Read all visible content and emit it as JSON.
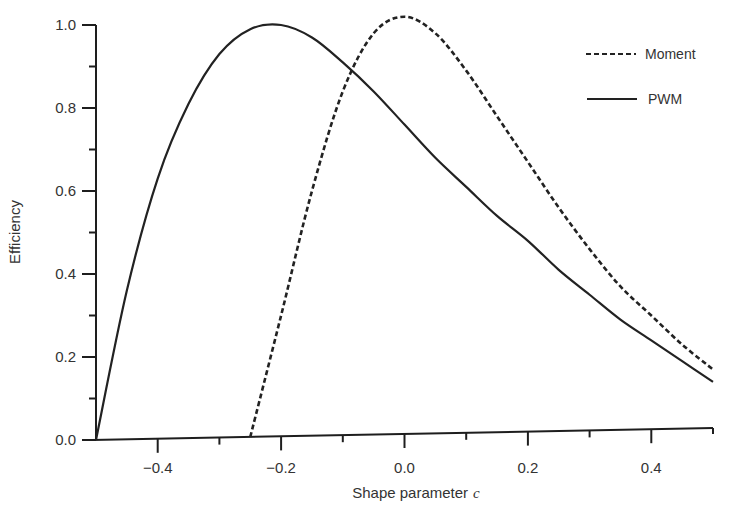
{
  "chart_data": {
    "type": "line",
    "title": "",
    "xlabel": "Shape parameter",
    "xlabel_var": "c",
    "ylabel": "Efficiency",
    "xlim": [
      -0.5,
      0.5
    ],
    "ylim": [
      0.0,
      1.0
    ],
    "grid": false,
    "legend_position": "upper right",
    "x_ticks": [
      -0.4,
      -0.2,
      0.0,
      0.2,
      0.4
    ],
    "x_tick_labels": [
      "−0.4",
      "−0.2",
      "0.0",
      "0.2",
      "0.4"
    ],
    "x_minor_ticks": [
      -0.5,
      -0.3,
      -0.1,
      0.1,
      0.3,
      0.5
    ],
    "y_ticks": [
      0.0,
      0.2,
      0.4,
      0.6,
      0.8,
      1.0
    ],
    "y_tick_labels": [
      "0.0",
      "0.2",
      "0.4",
      "0.6",
      "0.8",
      "1.0"
    ],
    "y_minor_ticks": [
      0.1,
      0.3,
      0.5,
      0.7,
      0.9
    ],
    "series": [
      {
        "name": "Moment",
        "style": "dashed",
        "x": [
          -0.25,
          -0.2,
          -0.15,
          -0.1,
          -0.05,
          0.0,
          0.05,
          0.1,
          0.15,
          0.2,
          0.25,
          0.3,
          0.35,
          0.4,
          0.45,
          0.5
        ],
        "values": [
          0.0,
          0.3,
          0.6,
          0.84,
          0.98,
          1.02,
          0.98,
          0.89,
          0.78,
          0.67,
          0.56,
          0.46,
          0.37,
          0.3,
          0.23,
          0.17
        ]
      },
      {
        "name": "PWM",
        "style": "solid",
        "x": [
          -0.5,
          -0.45,
          -0.4,
          -0.35,
          -0.3,
          -0.25,
          -0.2,
          -0.15,
          -0.1,
          -0.05,
          0.0,
          0.05,
          0.1,
          0.15,
          0.2,
          0.25,
          0.3,
          0.35,
          0.4,
          0.45,
          0.5
        ],
        "values": [
          0.0,
          0.36,
          0.63,
          0.81,
          0.93,
          0.99,
          1.0,
          0.97,
          0.91,
          0.84,
          0.76,
          0.68,
          0.61,
          0.54,
          0.48,
          0.41,
          0.35,
          0.29,
          0.24,
          0.19,
          0.14
        ]
      }
    ]
  },
  "legend": {
    "items": [
      {
        "label": "Moment",
        "style": "dashed"
      },
      {
        "label": "PWM",
        "style": "solid"
      }
    ]
  },
  "axes": {
    "xlabel": "Shape parameter",
    "xlabel_var": "c",
    "ylabel": "Efficiency"
  },
  "colors": {
    "line": "#222222",
    "axis": "#1e1e1e",
    "text": "#333333",
    "background": "#ffffff"
  }
}
